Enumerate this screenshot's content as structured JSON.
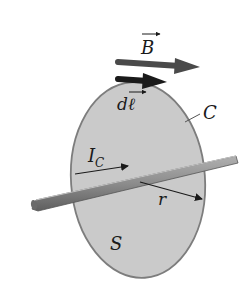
{
  "diagram": {
    "type": "Ampere's law illustration",
    "labels": {
      "field": "B",
      "line_element_d": "d",
      "line_element_l": "ℓ",
      "curve": "C",
      "current_I": "I",
      "current_sub": "C",
      "radius": "r",
      "surface": "S"
    },
    "colors": {
      "surface_fill": "#c9c9c9",
      "surface_stroke": "#7a7a7a",
      "wire": "#8a8a8a",
      "b_arrow": "#4a4a4a",
      "dl_arrow": "#1a1a1a",
      "text": "#1a1a1a"
    }
  }
}
